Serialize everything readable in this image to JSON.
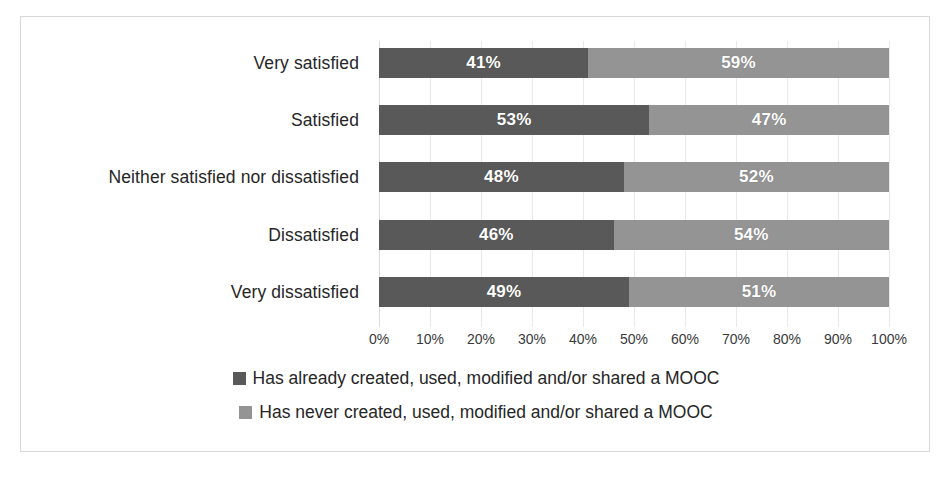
{
  "chart_data": {
    "type": "bar",
    "orientation": "horizontal",
    "stacked": true,
    "stack_total_percent": 100,
    "title": "",
    "subtitle": "",
    "xlabel": "",
    "ylabel": "",
    "xlim": [
      0,
      100
    ],
    "grid": true,
    "legend_position": "bottom",
    "categories": [
      "Very satisfied",
      "Satisfied",
      "Neither satisfied nor dissatisfied",
      "Dissatisfied",
      "Very dissatisfied"
    ],
    "tick_labels": [
      "0%",
      "10%",
      "20%",
      "30%",
      "40%",
      "50%",
      "60%",
      "70%",
      "80%",
      "90%",
      "100%"
    ],
    "tick_values": [
      0,
      10,
      20,
      30,
      40,
      50,
      60,
      70,
      80,
      90,
      100
    ],
    "series": [
      {
        "name": "Has already created, used, modified and/or shared a MOOC",
        "color": "#595959",
        "values": [
          41,
          53,
          48,
          46,
          49
        ],
        "data_labels": [
          "41%",
          "53%",
          "48%",
          "46%",
          "49%"
        ]
      },
      {
        "name": "Has never created, used, modified and/or shared a MOOC",
        "color": "#949494",
        "values": [
          59,
          47,
          52,
          54,
          51
        ],
        "data_labels": [
          "59%",
          "47%",
          "52%",
          "54%",
          "51%"
        ]
      }
    ]
  },
  "legend": {
    "items": [
      {
        "label": "Has already created, used, modified and/or shared a MOOC",
        "color": "#595959"
      },
      {
        "label": "Has never created, used, modified and/or shared a MOOC",
        "color": "#949494"
      }
    ]
  },
  "colors": {
    "series_dark": "#595959",
    "series_light": "#949494",
    "gridline": "#e9e9e9",
    "frame_border": "#d8d8d8",
    "label_text": "#262626",
    "data_label_text": "#ffffff"
  }
}
